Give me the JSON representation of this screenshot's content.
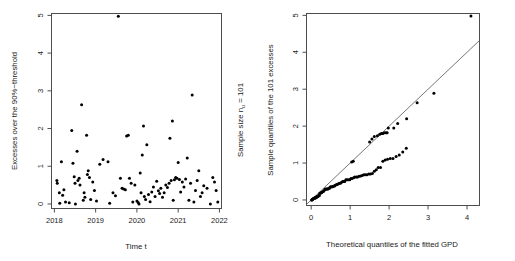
{
  "figure": {
    "panels": [
      {
        "id": "excesses-scatter",
        "xlabel": "Time t",
        "ylabel": "Excesses over the 90%−threshold",
        "right_label": "Sample size n",
        "right_label_sub": "u",
        "right_label_tail": " = 101",
        "xticks": [
          "2018",
          "2019",
          "2020",
          "2021",
          "2022"
        ],
        "yticks": [
          "0",
          "1",
          "2",
          "3",
          "4",
          "5"
        ]
      },
      {
        "id": "gpd-qqplot",
        "xlabel": "Theoretical quantiles of the fitted GPD",
        "ylabel": "Sample quantiles of the 101 excesses",
        "xticks": [
          "0",
          "1",
          "2",
          "3",
          "4"
        ],
        "yticks": [
          "0",
          "1",
          "2",
          "3",
          "4",
          "5"
        ]
      }
    ]
  },
  "chart_data": [
    {
      "type": "scatter",
      "title": "",
      "xlabel": "Time t",
      "ylabel": "Excesses over the 90%−threshold",
      "xlim": [
        2017.93,
        2022.05
      ],
      "ylim": [
        -0.12,
        5.05
      ],
      "xticks": [
        2018,
        2019,
        2020,
        2021,
        2022
      ],
      "yticks": [
        0,
        1,
        2,
        3,
        4,
        5
      ],
      "grid": false,
      "legend": null,
      "annotation": "Sample size n_u = 101",
      "n_points": 101,
      "points": [
        [
          2018.06,
          0.62
        ],
        [
          2018.07,
          0.55
        ],
        [
          2018.12,
          0.3
        ],
        [
          2018.13,
          0.02
        ],
        [
          2018.17,
          1.12
        ],
        [
          2018.2,
          0.23
        ],
        [
          2018.23,
          0.38
        ],
        [
          2018.27,
          0.05
        ],
        [
          2018.36,
          0.03
        ],
        [
          2018.42,
          1.95
        ],
        [
          2018.45,
          1.08
        ],
        [
          2018.48,
          0.72
        ],
        [
          2018.5,
          0.55
        ],
        [
          2018.51,
          0.0
        ],
        [
          2018.55,
          1.4
        ],
        [
          2018.57,
          0.62
        ],
        [
          2018.6,
          0.68
        ],
        [
          2018.62,
          0.5
        ],
        [
          2018.66,
          2.63
        ],
        [
          2018.7,
          0.1
        ],
        [
          2018.72,
          0.3
        ],
        [
          2018.74,
          0.18
        ],
        [
          2018.78,
          1.82
        ],
        [
          2018.8,
          0.78
        ],
        [
          2018.82,
          0.88
        ],
        [
          2018.85,
          0.7
        ],
        [
          2018.88,
          0.12
        ],
        [
          2018.93,
          0.58
        ],
        [
          2018.97,
          0.36
        ],
        [
          2019.02,
          0.08
        ],
        [
          2019.1,
          1.05
        ],
        [
          2019.18,
          1.18
        ],
        [
          2019.3,
          1.12
        ],
        [
          2019.34,
          0.02
        ],
        [
          2019.42,
          0.3
        ],
        [
          2019.48,
          0.22
        ],
        [
          2019.55,
          4.98
        ],
        [
          2019.6,
          0.68
        ],
        [
          2019.64,
          0.42
        ],
        [
          2019.68,
          0.4
        ],
        [
          2019.72,
          0.38
        ],
        [
          2019.75,
          1.8
        ],
        [
          2019.79,
          1.82
        ],
        [
          2019.82,
          0.68
        ],
        [
          2019.86,
          0.55
        ],
        [
          2019.9,
          0.05
        ],
        [
          2019.95,
          0.5
        ],
        [
          2020.0,
          0.08
        ],
        [
          2020.03,
          0.04
        ],
        [
          2020.05,
          0.0
        ],
        [
          2020.08,
          0.82
        ],
        [
          2020.1,
          0.3
        ],
        [
          2020.13,
          1.3
        ],
        [
          2020.16,
          2.07
        ],
        [
          2020.18,
          0.2
        ],
        [
          2020.21,
          0.12
        ],
        [
          2020.24,
          1.57
        ],
        [
          2020.28,
          0.25
        ],
        [
          2020.32,
          0.06
        ],
        [
          2020.36,
          0.32
        ],
        [
          2020.4,
          0.45
        ],
        [
          2020.44,
          0.2
        ],
        [
          2020.48,
          0.6
        ],
        [
          2020.52,
          0.35
        ],
        [
          2020.55,
          0.28
        ],
        [
          2020.58,
          0.42
        ],
        [
          2020.62,
          0.18
        ],
        [
          2020.66,
          0.3
        ],
        [
          2020.7,
          0.5
        ],
        [
          2020.74,
          0.44
        ],
        [
          2020.78,
          0.55
        ],
        [
          2020.8,
          1.74
        ],
        [
          2020.83,
          0.62
        ],
        [
          2020.86,
          2.2
        ],
        [
          2020.88,
          0.1
        ],
        [
          2020.91,
          0.64
        ],
        [
          2020.94,
          0.7
        ],
        [
          2020.97,
          0.68
        ],
        [
          2021.0,
          1.1
        ],
        [
          2021.03,
          0.65
        ],
        [
          2021.06,
          0.32
        ],
        [
          2021.1,
          0.58
        ],
        [
          2021.14,
          0.45
        ],
        [
          2021.18,
          0.66
        ],
        [
          2021.22,
          1.22
        ],
        [
          2021.26,
          0.1
        ],
        [
          2021.3,
          0.55
        ],
        [
          2021.34,
          2.89
        ],
        [
          2021.38,
          0.05
        ],
        [
          2021.42,
          0.36
        ],
        [
          2021.46,
          0.62
        ],
        [
          2021.5,
          0.88
        ],
        [
          2021.54,
          0.2
        ],
        [
          2021.58,
          0.3
        ],
        [
          2021.62,
          0.48
        ],
        [
          2021.7,
          0.42
        ],
        [
          2021.78,
          0.0
        ],
        [
          2021.84,
          0.7
        ],
        [
          2021.88,
          0.58
        ],
        [
          2021.92,
          0.36
        ],
        [
          2021.96,
          0.05
        ]
      ]
    },
    {
      "type": "scatter",
      "title": "",
      "xlabel": "Theoretical quantiles of the fitted GPD",
      "ylabel": "Sample quantiles of the 101 excesses",
      "xlim": [
        -0.12,
        4.32
      ],
      "ylim": [
        -0.15,
        5.05
      ],
      "xticks": [
        0,
        1,
        2,
        3,
        4
      ],
      "yticks": [
        0,
        1,
        2,
        3,
        4,
        5
      ],
      "grid": false,
      "legend": null,
      "reference_line": {
        "x": [
          -0.12,
          4.32
        ],
        "y": [
          -0.12,
          4.32
        ],
        "slope": 1,
        "intercept": 0
      },
      "points": [
        [
          0.01,
          0.0
        ],
        [
          0.02,
          0.0
        ],
        [
          0.03,
          0.02
        ],
        [
          0.04,
          0.02
        ],
        [
          0.05,
          0.03
        ],
        [
          0.07,
          0.04
        ],
        [
          0.08,
          0.05
        ],
        [
          0.09,
          0.05
        ],
        [
          0.1,
          0.05
        ],
        [
          0.12,
          0.06
        ],
        [
          0.13,
          0.08
        ],
        [
          0.15,
          0.08
        ],
        [
          0.16,
          0.1
        ],
        [
          0.18,
          0.1
        ],
        [
          0.19,
          0.12
        ],
        [
          0.21,
          0.12
        ],
        [
          0.22,
          0.18
        ],
        [
          0.24,
          0.18
        ],
        [
          0.26,
          0.2
        ],
        [
          0.27,
          0.2
        ],
        [
          0.29,
          0.22
        ],
        [
          0.31,
          0.23
        ],
        [
          0.33,
          0.25
        ],
        [
          0.35,
          0.28
        ],
        [
          0.37,
          0.3
        ],
        [
          0.39,
          0.3
        ],
        [
          0.41,
          0.3
        ],
        [
          0.43,
          0.3
        ],
        [
          0.45,
          0.32
        ],
        [
          0.47,
          0.32
        ],
        [
          0.49,
          0.35
        ],
        [
          0.51,
          0.36
        ],
        [
          0.53,
          0.36
        ],
        [
          0.55,
          0.36
        ],
        [
          0.58,
          0.38
        ],
        [
          0.6,
          0.38
        ],
        [
          0.62,
          0.4
        ],
        [
          0.65,
          0.42
        ],
        [
          0.67,
          0.42
        ],
        [
          0.7,
          0.44
        ],
        [
          0.72,
          0.45
        ],
        [
          0.75,
          0.45
        ],
        [
          0.78,
          0.48
        ],
        [
          0.81,
          0.5
        ],
        [
          0.83,
          0.5
        ],
        [
          0.86,
          0.5
        ],
        [
          0.89,
          0.55
        ],
        [
          0.92,
          0.55
        ],
        [
          0.95,
          0.55
        ],
        [
          0.99,
          0.55
        ],
        [
          1.02,
          0.58
        ],
        [
          1.05,
          0.58
        ],
        [
          1.04,
          1.03
        ],
        [
          1.08,
          1.05
        ],
        [
          1.09,
          0.6
        ],
        [
          1.12,
          0.62
        ],
        [
          1.16,
          0.62
        ],
        [
          1.19,
          0.62
        ],
        [
          1.23,
          0.64
        ],
        [
          1.27,
          0.65
        ],
        [
          1.31,
          0.66
        ],
        [
          1.35,
          0.68
        ],
        [
          1.39,
          0.68
        ],
        [
          1.43,
          0.68
        ],
        [
          1.48,
          0.7
        ],
        [
          1.52,
          0.7
        ],
        [
          1.57,
          0.72
        ],
        [
          1.62,
          0.78
        ],
        [
          1.67,
          0.82
        ],
        [
          1.72,
          0.88
        ],
        [
          1.78,
          0.88
        ],
        [
          1.84,
          1.05
        ],
        [
          1.9,
          1.08
        ],
        [
          1.96,
          1.1
        ],
        [
          2.03,
          1.12
        ],
        [
          2.1,
          1.12
        ],
        [
          2.18,
          1.18
        ],
        [
          2.26,
          1.22
        ],
        [
          2.35,
          1.3
        ],
        [
          2.44,
          1.4
        ],
        [
          1.5,
          1.57
        ],
        [
          1.56,
          1.65
        ],
        [
          1.62,
          1.72
        ],
        [
          1.7,
          1.74
        ],
        [
          1.76,
          1.78
        ],
        [
          1.8,
          1.8
        ],
        [
          1.84,
          1.8
        ],
        [
          1.88,
          1.82
        ],
        [
          1.92,
          1.82
        ],
        [
          1.95,
          1.82
        ],
        [
          1.98,
          1.95
        ],
        [
          2.12,
          1.95
        ],
        [
          2.22,
          2.07
        ],
        [
          2.45,
          2.2
        ],
        [
          2.72,
          2.63
        ],
        [
          3.15,
          2.89
        ],
        [
          4.1,
          4.98
        ],
        [
          0.06,
          0.03
        ],
        [
          0.11,
          0.06
        ],
        [
          0.14,
          0.08
        ],
        [
          0.17,
          0.1
        ]
      ]
    }
  ]
}
